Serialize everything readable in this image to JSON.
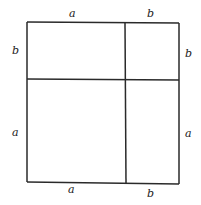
{
  "diagram": {
    "title": "",
    "labels": {
      "top_left": "a",
      "top_right": "b",
      "left_upper": "b",
      "left_lower": "a",
      "right_upper": "b",
      "right_lower": "a",
      "bottom_left": "a",
      "bottom_right": "b"
    },
    "regions": [
      {
        "id": "top-left",
        "width": "a",
        "height": "b"
      },
      {
        "id": "top-right",
        "width": "b",
        "height": "b"
      },
      {
        "id": "bottom-left",
        "width": "a",
        "height": "a"
      },
      {
        "id": "bottom-right",
        "width": "b",
        "height": "a"
      }
    ],
    "colors": {
      "line": "#2a2a2a",
      "background": "#ffffff"
    }
  }
}
